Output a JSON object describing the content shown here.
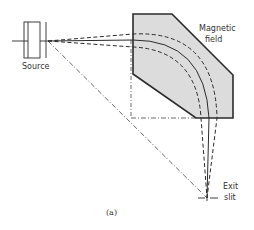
{
  "figure": {
    "caption": "(a)",
    "colors": {
      "background": "#ffffff",
      "stroke": "#2b2b2b",
      "field_fill": "#dcdcdc",
      "text": "#333333"
    }
  },
  "labels": {
    "source": "Source",
    "magnetic_field_line1": "Magnetic",
    "magnetic_field_line2": "field",
    "exit_line1": "Exit",
    "exit_line2": "slit"
  }
}
